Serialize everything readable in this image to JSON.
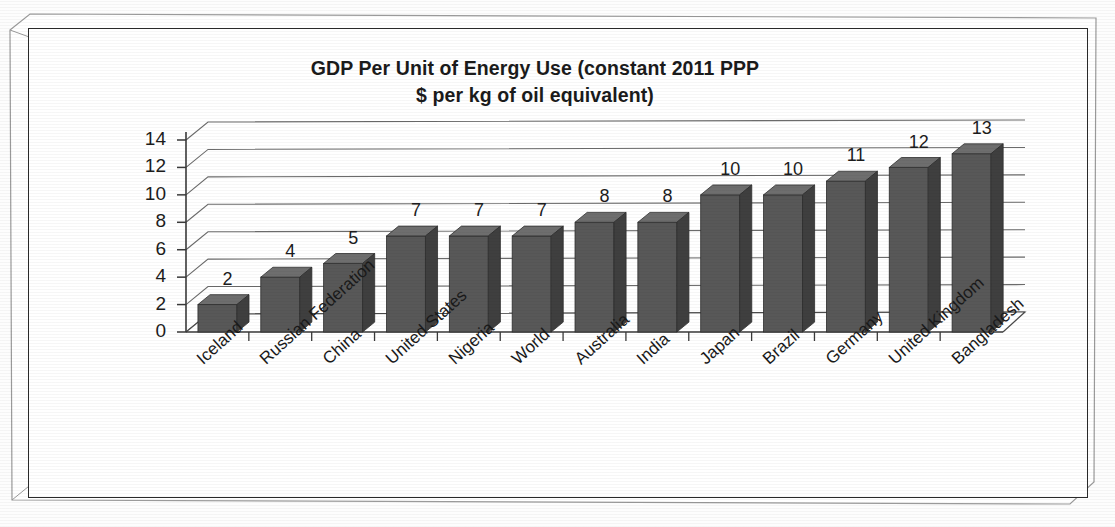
{
  "chart_data": {
    "type": "bar",
    "title": "GDP Per Unit of Energy Use (constant 2011 PPP $ per kg of oil equivalent)",
    "title_line1": "GDP Per Unit of Energy Use (constant 2011 PPP",
    "title_line2": "$ per kg of oil equivalent)",
    "xlabel": "",
    "ylabel": "",
    "ylim": [
      0,
      14
    ],
    "ytick_labels": [
      "14",
      "12",
      "10",
      "8",
      "6",
      "4",
      "2",
      "0"
    ],
    "ytick_values": [
      14,
      12,
      10,
      8,
      6,
      4,
      2,
      0
    ],
    "grid": true,
    "legend": "none",
    "style": "3d-column",
    "bar_color": "#585858",
    "bar_top_color": "#6e6e6e",
    "bar_side_color": "#3f3f3f",
    "categories": [
      "Iceland",
      "Russian Federation",
      "China",
      "United States",
      "Nigeria",
      "World",
      "Australia",
      "India",
      "Japan",
      "Brazil",
      "Germany",
      "United Kingdom",
      "Bangladesh"
    ],
    "values": [
      2,
      4,
      5,
      7,
      7,
      7,
      8,
      8,
      10,
      10,
      11,
      12,
      13
    ],
    "data_labels": [
      "2",
      "4",
      "5",
      "7",
      "7",
      "7",
      "8",
      "8",
      "10",
      "10",
      "11",
      "12",
      "13"
    ]
  }
}
